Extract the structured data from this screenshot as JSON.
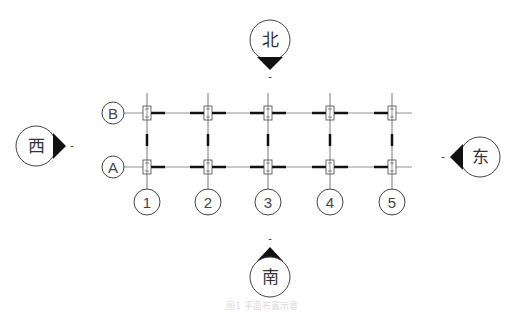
{
  "diagram": {
    "type": "structural-grid-plan",
    "compass": {
      "north": "北",
      "south": "南",
      "east": "东",
      "west": "西",
      "tick_mark": "-"
    },
    "row_axes": [
      "B",
      "A"
    ],
    "column_axes": [
      "1",
      "2",
      "3",
      "4",
      "5"
    ],
    "caption": "图1  平面布置示意",
    "colors": {
      "line": "#333333",
      "grid": "#555555",
      "caption": "#dddddd"
    }
  }
}
